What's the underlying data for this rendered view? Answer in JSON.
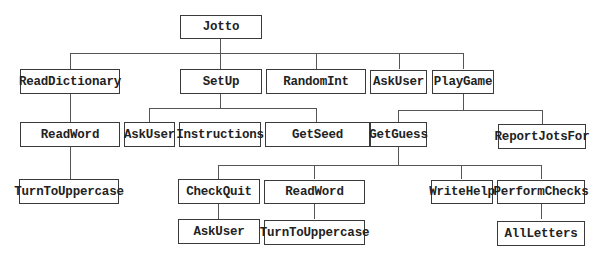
{
  "diagram": {
    "type": "structure-chart",
    "root": "Jotto",
    "nodes": {
      "jotto": "Jotto",
      "read_dictionary": "ReadDictionary",
      "setup": "SetUp",
      "random_int": "RandomInt",
      "ask_user_1": "AskUser",
      "play_game": "PlayGame",
      "read_word_1": "ReadWord",
      "ask_user_2": "AskUser",
      "instructions": "Instructions",
      "get_seed": "GetSeed",
      "get_guess": "GetGuess",
      "report_jots_for": "ReportJotsFor",
      "turn_to_uppercase_1": "TurnToUppercase",
      "check_quit": "CheckQuit",
      "read_word_2": "ReadWord",
      "write_help": "WriteHelp",
      "perform_checks": "PerformChecks",
      "ask_user_3": "AskUser",
      "turn_to_uppercase_2": "TurnToUppercase",
      "all_letters": "AllLetters"
    },
    "edges": [
      [
        "Jotto",
        "ReadDictionary"
      ],
      [
        "Jotto",
        "SetUp"
      ],
      [
        "Jotto",
        "RandomInt"
      ],
      [
        "Jotto",
        "AskUser"
      ],
      [
        "Jotto",
        "PlayGame"
      ],
      [
        "ReadDictionary",
        "ReadWord"
      ],
      [
        "ReadWord",
        "TurnToUppercase"
      ],
      [
        "SetUp",
        "AskUser"
      ],
      [
        "SetUp",
        "Instructions"
      ],
      [
        "SetUp",
        "GetSeed"
      ],
      [
        "PlayGame",
        "GetGuess"
      ],
      [
        "PlayGame",
        "ReportJotsFor"
      ],
      [
        "GetGuess",
        "CheckQuit"
      ],
      [
        "GetGuess",
        "ReadWord"
      ],
      [
        "GetGuess",
        "WriteHelp"
      ],
      [
        "GetGuess",
        "PerformChecks"
      ],
      [
        "CheckQuit",
        "AskUser"
      ],
      [
        "ReadWord",
        "TurnToUppercase"
      ],
      [
        "PerformChecks",
        "AllLetters"
      ]
    ]
  }
}
